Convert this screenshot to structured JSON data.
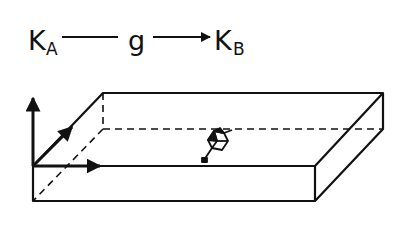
{
  "equation": {
    "source": {
      "symbol": "K",
      "subscript": "A"
    },
    "operator": "g",
    "target": {
      "symbol": "K",
      "subscript": "B"
    }
  },
  "figure": {
    "stroke_color": "#111111"
  }
}
